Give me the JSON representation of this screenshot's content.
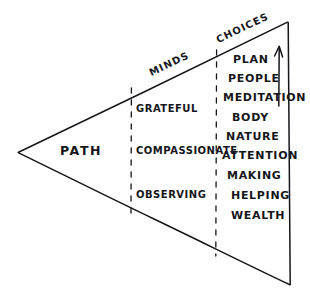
{
  "diagram": {
    "style": "hand-drawn ink sketch",
    "ink_color": "#15161a",
    "background_color": "#ffffff",
    "sections": {
      "apex": {
        "label": "PATH",
        "x": 60,
        "y": 145
      },
      "middle": {
        "heading": "MINDS",
        "heading_x": 152,
        "heading_y": 68,
        "items": [
          {
            "label": "GRATEFUL",
            "y": 104
          },
          {
            "label": "COMPASSIONATE",
            "y": 146
          },
          {
            "label": "OBSERVING",
            "y": 190
          }
        ]
      },
      "right": {
        "heading": "CHOICES",
        "heading_x": 219,
        "heading_y": 35,
        "items": [
          {
            "label": "PLAN",
            "x": 233,
            "y": 54
          },
          {
            "label": "PEOPLE",
            "x": 228,
            "y": 73
          },
          {
            "label": "MEDITATION",
            "x": 223,
            "y": 92
          },
          {
            "label": "BODY",
            "x": 232,
            "y": 112
          },
          {
            "label": "NATURE",
            "x": 226,
            "y": 131
          },
          {
            "label": "ATTENTION",
            "x": 222,
            "y": 150
          },
          {
            "label": "MAKING",
            "x": 227,
            "y": 170
          },
          {
            "label": "HELPING",
            "x": 231,
            "y": 190
          },
          {
            "label": "WEALTH",
            "x": 231,
            "y": 210
          }
        ]
      }
    },
    "geometry": {
      "apex_point": "18,152",
      "top_right_point": "288,22",
      "bottom_right_point": "290,285",
      "divider_1_x": 131,
      "divider_2_x": 216,
      "arrow_x": 279
    }
  }
}
